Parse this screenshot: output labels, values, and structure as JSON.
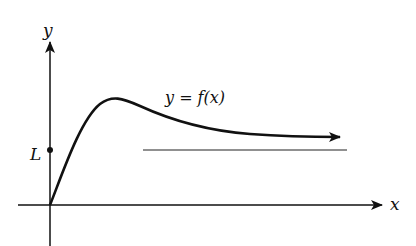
{
  "diagram": {
    "axes": {
      "x_label": "x",
      "y_label": "y"
    },
    "curve_label": "y = f(x)",
    "asymptote_label": "L"
  },
  "colors": {
    "ink": "#111111",
    "background": "#ffffff"
  }
}
